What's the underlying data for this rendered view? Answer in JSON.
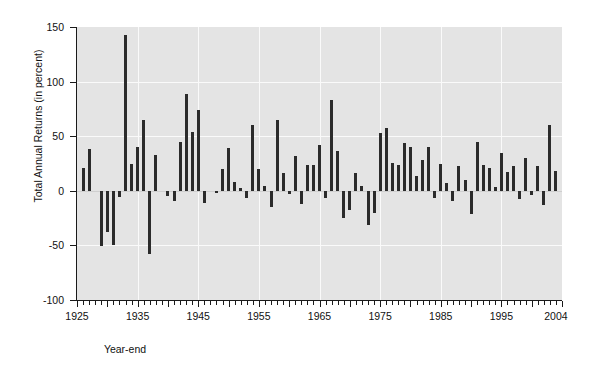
{
  "chart_data": {
    "type": "bar",
    "title": "",
    "xlabel": "Year-end",
    "ylabel": "Total Annual Returns (in percent)",
    "ylim": [
      -100,
      150
    ],
    "yticks": [
      150,
      100,
      50,
      0,
      -50,
      -100
    ],
    "xlim": [
      1925,
      2005
    ],
    "xticks_labeled": [
      1925,
      1935,
      1945,
      1955,
      1965,
      1975,
      1985,
      1995,
      2004
    ],
    "grid": true,
    "legend": "none",
    "bar_color": "#2b2b2b",
    "plot_background": "#e4e4e4",
    "gridline_color": "#fafafa",
    "categories": [
      1926,
      1927,
      1928,
      1929,
      1930,
      1931,
      1932,
      1933,
      1934,
      1935,
      1936,
      1937,
      1938,
      1939,
      1940,
      1941,
      1942,
      1943,
      1944,
      1945,
      1946,
      1947,
      1948,
      1949,
      1950,
      1951,
      1952,
      1953,
      1954,
      1955,
      1956,
      1957,
      1958,
      1959,
      1960,
      1961,
      1962,
      1963,
      1964,
      1965,
      1966,
      1967,
      1968,
      1969,
      1970,
      1971,
      1972,
      1973,
      1974,
      1975,
      1976,
      1977,
      1978,
      1979,
      1980,
      1981,
      1982,
      1983,
      1984,
      1985,
      1986,
      1987,
      1988,
      1989,
      1990,
      1991,
      1992,
      1993,
      1994,
      1995,
      1996,
      1997,
      1998,
      1999,
      2000,
      2001,
      2002,
      2003,
      2004
    ],
    "values": [
      21.0,
      38.5,
      0.0,
      -51.0,
      -38.0,
      -49.8,
      -5.4,
      142.9,
      24.2,
      40.2,
      64.8,
      -58.0,
      32.8,
      0.0,
      -5.2,
      -9.0,
      44.5,
      88.4,
      53.7,
      73.6,
      -11.6,
      0.0,
      -2.1,
      19.8,
      38.8,
      7.8,
      3.0,
      -6.5,
      60.6,
      20.4,
      4.3,
      -14.6,
      64.9,
      16.4,
      -3.3,
      32.1,
      -11.9,
      23.6,
      23.5,
      41.8,
      -7.0,
      83.6,
      36.0,
      -25.1,
      -17.4,
      16.5,
      4.4,
      -30.9,
      -20.0,
      52.8,
      57.4,
      25.4,
      23.5,
      43.5,
      39.9,
      13.9,
      28.0,
      39.7,
      -6.7,
      24.7,
      6.9,
      -9.3,
      22.9,
      10.2,
      -21.6,
      44.6,
      23.4,
      21.0,
      3.1,
      34.5,
      17.6,
      22.8,
      -7.3,
      29.8,
      -3.6,
      22.8,
      -13.3,
      60.7,
      18.4
    ]
  },
  "axis": {
    "y_labels": [
      "150",
      "100",
      "50",
      "0",
      "-50",
      "-100"
    ],
    "x_labels": [
      "1925",
      "1935",
      "1945",
      "1955",
      "1965",
      "1975",
      "1985",
      "1995",
      "2004"
    ],
    "y_title": "Total Annual Returns (in percent)",
    "x_title": "Year-end"
  }
}
